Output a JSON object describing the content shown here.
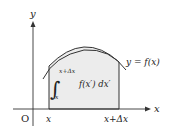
{
  "diagram": {
    "axes": {
      "y_label": "y",
      "x_label": "x",
      "origin_label": "O"
    },
    "curve_label": "y = f(x)",
    "lower_bound_label": "x",
    "upper_bound_label": "x+Δx",
    "integral": {
      "upper": "x+Δx",
      "lower": "x",
      "integrand": "f(x′) dx′"
    },
    "colors": {
      "shade": "#ececec",
      "stroke": "#333333"
    }
  }
}
